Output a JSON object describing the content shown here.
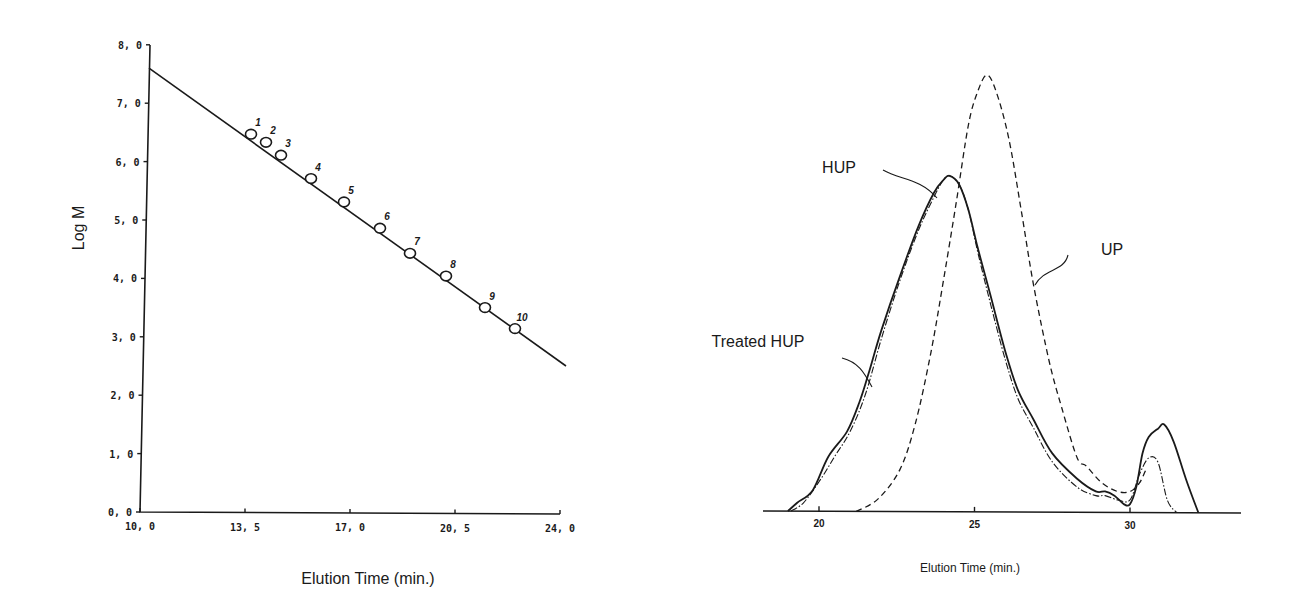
{
  "chart_data": [
    {
      "type": "scatter",
      "title": "",
      "xlabel": "Elution Time (min.)",
      "ylabel": "Log M",
      "xlim": [
        10.0,
        24.0
      ],
      "ylim": [
        0.0,
        8.0
      ],
      "x_ticks": [
        "10.0",
        "13.5",
        "17.0",
        "20.5",
        "24.0"
      ],
      "y_ticks": [
        "0.0",
        "1.0",
        "2.0",
        "3.0",
        "4.0",
        "5.0",
        "6.0",
        "7.0",
        "8.0"
      ],
      "grid": false,
      "legend": "none",
      "series": [
        {
          "name": "Calibration standards",
          "marker": "open-circle",
          "labels": [
            "1",
            "2",
            "3",
            "4",
            "5",
            "6",
            "7",
            "8",
            "9",
            "10"
          ],
          "x": [
            13.7,
            14.2,
            14.7,
            15.7,
            16.8,
            18.0,
            19.0,
            20.2,
            21.5,
            22.5
          ],
          "y": [
            6.47,
            6.33,
            6.11,
            5.71,
            5.31,
            4.86,
            4.43,
            4.04,
            3.5,
            3.14
          ]
        },
        {
          "name": "Linear fit",
          "line": "solid",
          "x": [
            10.3,
            24.2
          ],
          "y": [
            7.6,
            2.5
          ]
        }
      ]
    },
    {
      "type": "line",
      "title": "",
      "xlabel": "Elution Time  (min.)",
      "ylabel": "",
      "xlim": [
        18.2,
        33.5
      ],
      "x_ticks": [
        "20",
        "25",
        "30"
      ],
      "y_ticks": [],
      "grid": false,
      "legend": "inline-annotations",
      "annotations": [
        "HUP",
        "UP",
        "Treated HUP"
      ],
      "series": [
        {
          "name": "HUP",
          "line": "solid",
          "x": [
            19.0,
            19.3,
            19.8,
            20.3,
            20.9,
            21.3,
            21.6,
            22.0,
            22.6,
            23.2,
            23.7,
            24.0,
            24.2,
            24.5,
            24.8,
            25.1,
            25.5,
            26.0,
            26.4,
            26.9,
            27.5,
            28.3,
            28.9,
            29.2,
            29.5,
            29.8,
            30.0,
            30.2,
            30.4,
            30.6,
            30.9,
            31.1,
            31.4,
            31.8,
            32.2
          ],
          "y": [
            0.0,
            0.02,
            0.05,
            0.13,
            0.19,
            0.26,
            0.33,
            0.43,
            0.56,
            0.68,
            0.76,
            0.79,
            0.8,
            0.78,
            0.72,
            0.63,
            0.52,
            0.38,
            0.29,
            0.22,
            0.14,
            0.08,
            0.05,
            0.05,
            0.04,
            0.02,
            0.02,
            0.06,
            0.14,
            0.18,
            0.2,
            0.21,
            0.17,
            0.08,
            0.0
          ]
        },
        {
          "name": "Treated HUP",
          "line": "dash-dot",
          "x": [
            19.1,
            19.5,
            20.0,
            20.5,
            21.0,
            21.5,
            22.0,
            22.6,
            23.2,
            23.7,
            24.0,
            24.2,
            24.5,
            24.8,
            25.1,
            25.5,
            26.0,
            26.4,
            26.9,
            27.5,
            28.3,
            28.9,
            29.2,
            29.6,
            30.0,
            30.3,
            30.6,
            30.9,
            31.2,
            31.5
          ],
          "y": [
            0.0,
            0.02,
            0.07,
            0.13,
            0.19,
            0.28,
            0.41,
            0.55,
            0.67,
            0.75,
            0.79,
            0.8,
            0.78,
            0.72,
            0.62,
            0.5,
            0.36,
            0.27,
            0.2,
            0.12,
            0.06,
            0.04,
            0.04,
            0.03,
            0.03,
            0.09,
            0.13,
            0.12,
            0.03,
            0.0
          ]
        },
        {
          "name": "UP",
          "line": "dashed",
          "x": [
            21.2,
            21.9,
            22.6,
            23.1,
            23.6,
            24.0,
            24.4,
            24.8,
            25.1,
            25.4,
            25.7,
            26.1,
            26.5,
            26.9,
            27.4,
            27.8,
            28.3,
            28.6,
            29.1,
            29.6,
            30.0,
            30.3,
            30.5
          ],
          "y": [
            0.0,
            0.03,
            0.1,
            0.21,
            0.38,
            0.55,
            0.73,
            0.92,
            1.0,
            1.04,
            1.0,
            0.89,
            0.72,
            0.54,
            0.36,
            0.25,
            0.13,
            0.11,
            0.07,
            0.05,
            0.05,
            0.07,
            0.1
          ]
        }
      ]
    }
  ],
  "left_chart": {
    "xlabel": "Elution Time (min.)",
    "ylabel": "Log M",
    "x_ticks": [
      "10.0",
      "13.5",
      "17.0",
      "20.5",
      "24.0"
    ],
    "y_ticks": [
      "0.0",
      "1.0",
      "2.0",
      "3.0",
      "4.0",
      "5.0",
      "6.0",
      "7.0",
      "8.0"
    ]
  },
  "right_chart": {
    "xlabel": "Elution Time  (min.)",
    "x_ticks": [
      "20",
      "25",
      "30"
    ],
    "labels": {
      "hup": "HUP",
      "up": "UP",
      "treated": "Treated HUP"
    }
  }
}
